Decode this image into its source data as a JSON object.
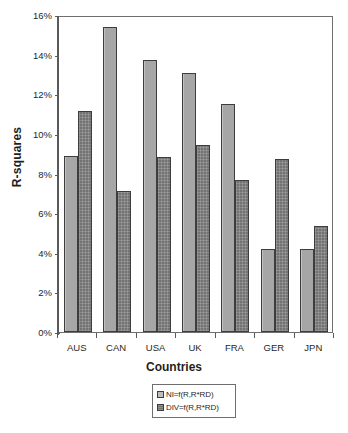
{
  "chart_data": {
    "type": "bar",
    "title": "",
    "xlabel": "Countries",
    "ylabel": "R-squares",
    "categories": [
      "AUS",
      "CAN",
      "USA",
      "UK",
      "FRA",
      "GER",
      "JPN"
    ],
    "series": [
      {
        "name": "NI=f(R,R*RD)",
        "values": [
          8.9,
          15.4,
          13.75,
          13.05,
          11.5,
          4.2,
          4.2
        ]
      },
      {
        "name": "DIV=f(R,R*RD)",
        "values": [
          11.15,
          7.1,
          8.85,
          9.45,
          7.65,
          8.75,
          5.35
        ]
      }
    ],
    "ylim": [
      0,
      16
    ],
    "ytick_step": 2,
    "ytick_labels": [
      "0%",
      "2%",
      "4%",
      "6%",
      "8%",
      "10%",
      "12%",
      "14%",
      "16%"
    ],
    "ytick_values": [
      0,
      2,
      4,
      6,
      8,
      10,
      12,
      14,
      16
    ],
    "value_suffix": "%",
    "grid": false,
    "legend_position": "below-axis-title",
    "colors": {
      "series_0": "#a6a6a6",
      "series_1": "#737373",
      "axis": "#5a5a5a",
      "bar_border": "#3d3d3d",
      "text": "#1f1f1f",
      "background": "#ffffff"
    }
  }
}
